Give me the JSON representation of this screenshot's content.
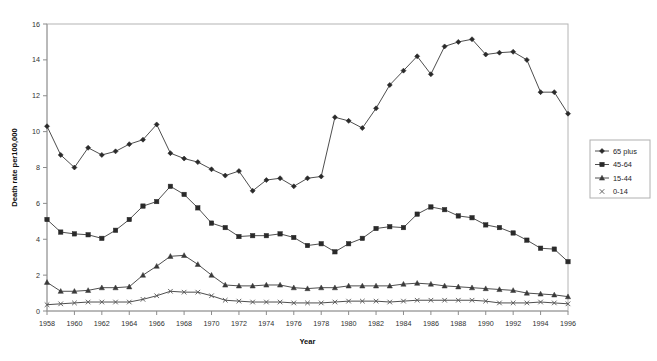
{
  "chart_data": {
    "type": "line",
    "title": "",
    "xlabel": "Year",
    "ylabel": "Death rate per100,000",
    "xlim": [
      1958,
      1996
    ],
    "ylim": [
      0,
      16
    ],
    "ytick_step": 2,
    "xtick_step": 2,
    "grid": false,
    "legend_position": "right",
    "yticks": [
      "0",
      "2",
      "4",
      "6",
      "8",
      "10",
      "12",
      "14",
      "16"
    ],
    "xticks": [
      "1958",
      "1960",
      "1962",
      "1964",
      "1966",
      "1968",
      "1970",
      "1972",
      "1974",
      "1976",
      "1978",
      "1980",
      "1982",
      "1984",
      "1986",
      "1988",
      "1990",
      "1992",
      "1994",
      "1996"
    ],
    "x": [
      1958,
      1959,
      1960,
      1961,
      1962,
      1963,
      1964,
      1965,
      1966,
      1967,
      1968,
      1969,
      1970,
      1971,
      1972,
      1973,
      1974,
      1975,
      1976,
      1977,
      1978,
      1979,
      1980,
      1981,
      1982,
      1983,
      1984,
      1985,
      1986,
      1987,
      1988,
      1989,
      1990,
      1991,
      1992,
      1993,
      1994,
      1995,
      1996
    ],
    "series": [
      {
        "name": "65 plus",
        "marker": "diamond",
        "color": "#2a2a2a",
        "values": [
          10.3,
          8.7,
          8.0,
          9.1,
          8.7,
          8.9,
          9.3,
          9.55,
          10.4,
          8.8,
          8.5,
          8.3,
          7.9,
          7.55,
          7.8,
          6.7,
          7.3,
          7.4,
          6.95,
          7.4,
          7.5,
          10.8,
          10.6,
          10.2,
          11.3,
          12.6,
          13.4,
          14.2,
          13.2,
          14.75,
          15.0,
          15.15,
          14.3,
          14.4,
          14.45,
          14.0,
          12.2,
          12.2,
          11.0
        ]
      },
      {
        "name": "45-64",
        "marker": "square",
        "color": "#2a2a2a",
        "values": [
          5.1,
          4.4,
          4.3,
          4.25,
          4.05,
          4.5,
          5.1,
          5.85,
          6.1,
          6.95,
          6.5,
          5.75,
          4.9,
          4.65,
          4.15,
          4.2,
          4.2,
          4.3,
          4.1,
          3.65,
          3.75,
          3.3,
          3.75,
          4.05,
          4.6,
          4.7,
          4.65,
          5.4,
          5.8,
          5.65,
          5.3,
          5.2,
          4.8,
          4.65,
          4.35,
          3.95,
          3.5,
          3.45,
          2.75
        ]
      },
      {
        "name": "15-44",
        "marker": "triangle",
        "color": "#3a3a3a",
        "values": [
          1.6,
          1.1,
          1.1,
          1.15,
          1.3,
          1.3,
          1.35,
          2.0,
          2.5,
          3.05,
          3.1,
          2.6,
          2.0,
          1.45,
          1.4,
          1.4,
          1.45,
          1.45,
          1.3,
          1.25,
          1.3,
          1.3,
          1.4,
          1.4,
          1.4,
          1.4,
          1.5,
          1.55,
          1.5,
          1.4,
          1.35,
          1.3,
          1.25,
          1.2,
          1.15,
          1.0,
          0.95,
          0.9,
          0.8
        ]
      },
      {
        "name": "0-14",
        "marker": "x",
        "color": "#555555",
        "values": [
          0.35,
          0.4,
          0.45,
          0.5,
          0.5,
          0.5,
          0.5,
          0.65,
          0.85,
          1.1,
          1.05,
          1.05,
          0.85,
          0.6,
          0.55,
          0.5,
          0.5,
          0.5,
          0.45,
          0.45,
          0.45,
          0.5,
          0.55,
          0.55,
          0.55,
          0.5,
          0.55,
          0.6,
          0.6,
          0.6,
          0.6,
          0.6,
          0.55,
          0.45,
          0.45,
          0.45,
          0.5,
          0.45,
          0.4
        ]
      }
    ]
  },
  "legend": {
    "items": [
      {
        "label": "65 plus"
      },
      {
        "label": "45-64"
      },
      {
        "label": "15-44"
      },
      {
        "label": "0-14"
      }
    ]
  }
}
